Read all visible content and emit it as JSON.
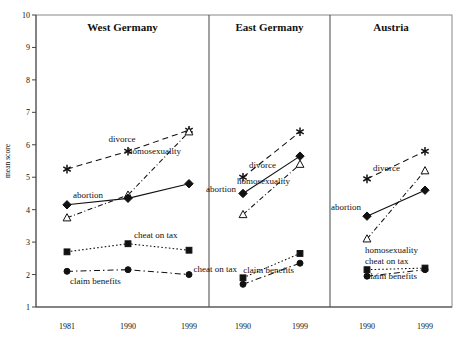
{
  "figure": {
    "ylabel": "mean score",
    "y_ticks": [
      1,
      2,
      3,
      4,
      5,
      6,
      7,
      8,
      9,
      10
    ],
    "ylim": [
      1,
      10
    ]
  },
  "chart_data": {
    "type": "line",
    "title": "",
    "xlabel": "",
    "ylabel": "mean score",
    "ylim": [
      1,
      10
    ],
    "grid": false,
    "legend": "inline-annotations",
    "panels": [
      {
        "name": "West Germany",
        "x": [
          "1981",
          "1990",
          "1999"
        ],
        "series": [
          {
            "name": "divorce",
            "marker": "asterisk",
            "line": "dashed",
            "values": [
              5.25,
              5.8,
              6.45
            ],
            "label_x": "1990",
            "label_pos": "above-left"
          },
          {
            "name": "homosexuality",
            "marker": "open-triangle",
            "line": "dash-dot",
            "values": [
              3.75,
              4.45,
              6.4
            ],
            "label_x": "1999",
            "label_pos": "left-below"
          },
          {
            "name": "abortion",
            "marker": "filled-diamond",
            "line": "solid",
            "values": [
              4.15,
              4.35,
              4.8
            ],
            "label_x": "1981",
            "label_pos": "above-right"
          },
          {
            "name": "cheat on tax",
            "marker": "filled-square",
            "line": "dotted",
            "values": [
              2.7,
              2.95,
              2.75
            ],
            "label_x": "1990",
            "label_pos": "above-right"
          },
          {
            "name": "claim benefits",
            "marker": "filled-circle",
            "line": "dash-dot",
            "values": [
              2.1,
              2.15,
              2.0
            ],
            "label_x": "1981",
            "label_pos": "below-right"
          }
        ]
      },
      {
        "name": "East Germany",
        "x": [
          "1990",
          "1999"
        ],
        "series": [
          {
            "name": "divorce",
            "marker": "asterisk",
            "line": "dashed",
            "values": [
              5.0,
              6.4
            ],
            "label_x": "1990",
            "label_pos": "above-right"
          },
          {
            "name": "homosexuality",
            "marker": "open-triangle",
            "line": "dash-dot",
            "values": [
              3.85,
              5.4
            ],
            "label_x": "1999",
            "label_pos": "left-below"
          },
          {
            "name": "abortion",
            "marker": "filled-diamond",
            "line": "solid",
            "values": [
              4.5,
              5.65
            ],
            "label_x": "1990",
            "label_pos": "left"
          },
          {
            "name": "cheat on tax",
            "marker": "filled-square",
            "line": "dotted",
            "values": [
              1.9,
              2.65
            ],
            "label_x": "1990",
            "label_pos": "above-left"
          },
          {
            "name": "claim benefits",
            "marker": "filled-circle",
            "line": "dash-dot",
            "values": [
              1.7,
              2.35
            ],
            "label_x": "1999",
            "label_pos": "below-left"
          }
        ]
      },
      {
        "name": "Austria",
        "x": [
          "1990",
          "1999"
        ],
        "series": [
          {
            "name": "divorce",
            "marker": "asterisk",
            "line": "dashed",
            "values": [
              4.95,
              5.8
            ],
            "label_x": "1990",
            "label_pos": "above-right"
          },
          {
            "name": "homosexuality",
            "marker": "open-triangle",
            "line": "dash-dot",
            "values": [
              3.1,
              5.2
            ],
            "label_x": "1990",
            "label_pos": "below-right"
          },
          {
            "name": "abortion",
            "marker": "filled-diamond",
            "line": "solid",
            "values": [
              3.8,
              4.6
            ],
            "label_x": "1990",
            "label_pos": "left"
          },
          {
            "name": "cheat on tax",
            "marker": "filled-square",
            "line": "dotted",
            "values": [
              2.15,
              2.2
            ],
            "label_x": "1990",
            "label_pos": "above-right"
          },
          {
            "name": "claim benefits",
            "marker": "filled-circle",
            "line": "dash-dot",
            "values": [
              1.95,
              2.15
            ],
            "label_x": "1999",
            "label_pos": "below-left"
          }
        ]
      }
    ]
  },
  "panel_titles": {
    "west_germany": "West Germany",
    "east_germany": "East Germany",
    "austria": "Austria"
  },
  "series_labels": {
    "divorce": "divorce",
    "homosexuality": "homosexuality",
    "abortion": "abortion",
    "cheat_on_tax": "cheat on tax",
    "claim_benefits": "claim benefits"
  },
  "x_tick_labels": {
    "west": [
      "1981",
      "1990",
      "1999"
    ],
    "east": [
      "1990",
      "1999"
    ],
    "austria": [
      "1990",
      "1999"
    ]
  }
}
